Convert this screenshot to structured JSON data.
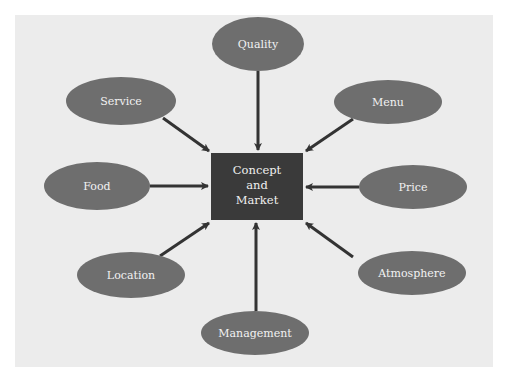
{
  "diagram": {
    "type": "hub-and-spoke",
    "colors": {
      "background": "#ffffff",
      "panel": "#ececec",
      "node_fill": "#6e6e6e",
      "center_fill": "#3a3a3a",
      "arrow": "#333333",
      "text": "#f2f2f2"
    },
    "center": {
      "lines": [
        "Concept",
        "and",
        "Market"
      ]
    },
    "nodes": [
      {
        "id": "quality",
        "label": "Quality"
      },
      {
        "id": "service",
        "label": "Service"
      },
      {
        "id": "menu",
        "label": "Menu"
      },
      {
        "id": "food",
        "label": "Food"
      },
      {
        "id": "price",
        "label": "Price"
      },
      {
        "id": "location",
        "label": "Location"
      },
      {
        "id": "atmosphere",
        "label": "Atmosphere"
      },
      {
        "id": "management",
        "label": "Management"
      }
    ],
    "edges": [
      {
        "from": "quality",
        "to": "center"
      },
      {
        "from": "service",
        "to": "center"
      },
      {
        "from": "menu",
        "to": "center"
      },
      {
        "from": "food",
        "to": "center"
      },
      {
        "from": "price",
        "to": "center"
      },
      {
        "from": "location",
        "to": "center"
      },
      {
        "from": "atmosphere",
        "to": "center"
      },
      {
        "from": "management",
        "to": "center"
      }
    ]
  }
}
